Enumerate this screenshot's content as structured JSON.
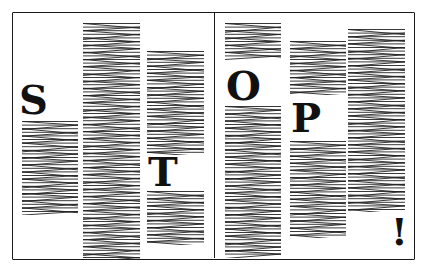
{
  "illustration": {
    "description": "Hand-drawn newspaper-style page with zigzag text columns spelling STOP!",
    "letters": [
      "S",
      "T",
      "O",
      "P",
      "!"
    ],
    "ink_color": "#111111",
    "paper_color": "#ffffff"
  },
  "columns": [
    {
      "id": "left-1",
      "x": 22,
      "top": 120,
      "bottom": 215,
      "width": 56
    },
    {
      "id": "left-2",
      "x": 83,
      "top": 22,
      "bottom": 260,
      "width": 57
    },
    {
      "id": "left-3",
      "x": 147,
      "top": 50,
      "bottom": 155,
      "width": 57
    },
    {
      "id": "left-3b",
      "x": 147,
      "top": 190,
      "bottom": 245,
      "width": 57
    },
    {
      "id": "right-1",
      "x": 225,
      "top": 22,
      "bottom": 60,
      "width": 56
    },
    {
      "id": "right-1b",
      "x": 225,
      "top": 105,
      "bottom": 258,
      "width": 56
    },
    {
      "id": "right-2",
      "x": 290,
      "top": 40,
      "bottom": 95,
      "width": 56
    },
    {
      "id": "right-2b",
      "x": 290,
      "top": 140,
      "bottom": 238,
      "width": 56
    },
    {
      "id": "right-3",
      "x": 348,
      "top": 28,
      "bottom": 212,
      "width": 57
    }
  ]
}
